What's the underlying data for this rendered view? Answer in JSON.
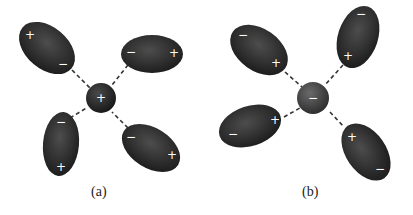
{
  "figure": {
    "panels": [
      {
        "id": "a",
        "caption": "(a)",
        "center_ion": {
          "charge": "+",
          "color": "#1e1e1e"
        },
        "dipoles": [
          {
            "position": "upper-left",
            "inner_end": "−",
            "outer_end": "+"
          },
          {
            "position": "upper-right",
            "inner_end": "−",
            "outer_end": "+"
          },
          {
            "position": "lower-left",
            "inner_end": "−",
            "outer_end": "+"
          },
          {
            "position": "lower-right",
            "inner_end": "−",
            "outer_end": "+"
          }
        ]
      },
      {
        "id": "b",
        "caption": "(b)",
        "center_ion": {
          "charge": "−",
          "color": "#3a3a3a"
        },
        "dipoles": [
          {
            "position": "upper-left",
            "inner_end": "+",
            "outer_end": "−"
          },
          {
            "position": "upper-right",
            "inner_end": "+",
            "outer_end": "−"
          },
          {
            "position": "lower-left",
            "inner_end": "+",
            "outer_end": "−"
          },
          {
            "position": "lower-right",
            "inner_end": "+",
            "outer_end": "−"
          }
        ]
      }
    ],
    "colors": {
      "dipole": "#262626",
      "line": "#333333",
      "background": "#ffffff"
    }
  }
}
